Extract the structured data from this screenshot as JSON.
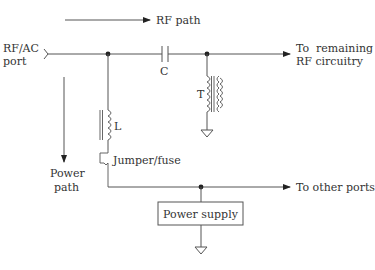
{
  "diagram": {
    "rf_path_label": "RF path",
    "port_label_line1": "RF/AC",
    "port_label_line2": "port",
    "capacitor_label": "C",
    "transformer_label": "T",
    "inductor_label": "L",
    "jumper_label": "Jumper/fuse",
    "power_path_line1": "Power",
    "power_path_line2": "path",
    "remaining_rf_line1": "To  remaining",
    "remaining_rf_line2": "RF circuitry",
    "other_ports_label": "To other ports",
    "power_supply_label": "Power supply",
    "colors": {
      "line": "#555555",
      "text": "#333333",
      "background": "#ffffff"
    }
  }
}
